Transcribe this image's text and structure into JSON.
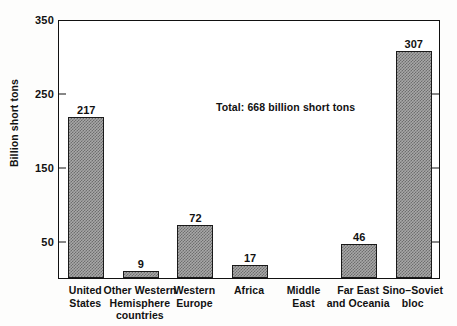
{
  "chart_data": {
    "type": "bar",
    "title": "",
    "subtitle": "",
    "xlabel": "",
    "ylabel": "Billion short tons",
    "ylim": [
      0,
      350
    ],
    "yticks": [
      50,
      150,
      250,
      350
    ],
    "ytick_labels": [
      "50",
      "150",
      "250",
      "350"
    ],
    "grid": false,
    "legend": false,
    "categories": [
      "United States",
      "Other Western Hemisphere countries",
      "Western Europe",
      "Africa",
      "Middle East",
      "Far East and Oceania",
      "Sino-Soviet bloc"
    ],
    "category_lines": [
      [
        "United",
        "States"
      ],
      [
        "Other Western",
        "Hemisphere",
        "countries"
      ],
      [
        "Western",
        "Europe"
      ],
      [
        "Africa"
      ],
      [
        "Middle",
        "East"
      ],
      [
        "Far East",
        "and Oceania"
      ],
      [
        "Sino–Soviet",
        "bloc"
      ]
    ],
    "values": [
      217,
      9,
      72,
      17,
      0,
      46,
      307
    ],
    "value_labels": [
      "217",
      "9",
      "72",
      "17",
      "",
      "46",
      "307"
    ],
    "annotations": [
      {
        "text": "Total:  668 billion short tons",
        "total": 668,
        "units": "billion short tons"
      }
    ],
    "bar_fill_color": "#a8a8a8",
    "bar_edge_color": "#1a1a1a",
    "axis_color": "#111111",
    "background_color": "#ffffff"
  },
  "figure": {
    "annotation_text": "Total:  668 billion short tons"
  }
}
